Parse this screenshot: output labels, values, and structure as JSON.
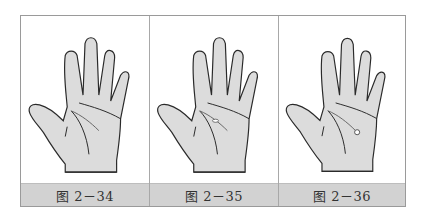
{
  "figure": {
    "panels": [
      {
        "caption": "图 2－34",
        "marker": "none"
      },
      {
        "caption": "图 2－35",
        "marker": "small-island"
      },
      {
        "caption": "图 2－36",
        "marker": "dot-end"
      }
    ]
  },
  "colors": {
    "hand_fill": "#dcdcdc",
    "outline": "#2a2a2a",
    "caption_bg": "#d2d2d2",
    "border": "#9a9a9a"
  }
}
